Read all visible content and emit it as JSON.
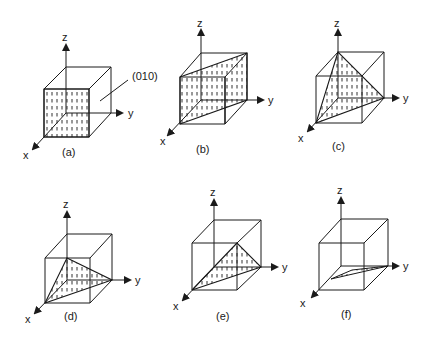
{
  "figure": {
    "axis_labels": {
      "x": "x",
      "y": "y",
      "z": "z"
    },
    "callout_label": "(010)",
    "panels": [
      {
        "id": "a",
        "caption": "(a)",
        "plane": "front face (x = const), hatched"
      },
      {
        "id": "b",
        "caption": "(b)",
        "plane": "diagonal plane through front-left and back-right vertical edges, hatched"
      },
      {
        "id": "c",
        "caption": "(c)",
        "plane": "triangular plane cutting x, y, z axes at unit distance, hatched"
      },
      {
        "id": "d",
        "caption": "(d)",
        "plane": "triangular plane cutting x, y axes and z at half height, hatched"
      },
      {
        "id": "e",
        "caption": "(e)",
        "plane": "triangular plane from front-top-right edge to x and y intercepts, hatched"
      },
      {
        "id": "f",
        "caption": "(f)",
        "plane": "thin sliver plane near base, hatched"
      }
    ]
  },
  "colors": {
    "ink": "#1a1a1a",
    "background": "#ffffff"
  }
}
